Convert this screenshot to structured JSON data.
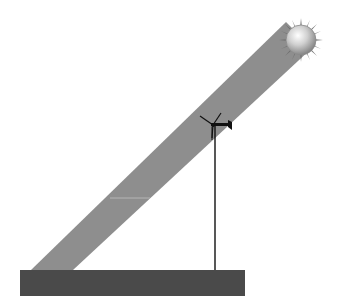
{
  "diagram": {
    "elements": {
      "sun": {
        "icon": "sun-icon",
        "color": "#b8b8b8"
      },
      "beam": {
        "color": "#8e8e8e"
      },
      "turbine": {
        "icon": "wind-turbine-icon",
        "color": "#111111"
      },
      "ground": {
        "color": "#4a4a4a"
      }
    }
  }
}
